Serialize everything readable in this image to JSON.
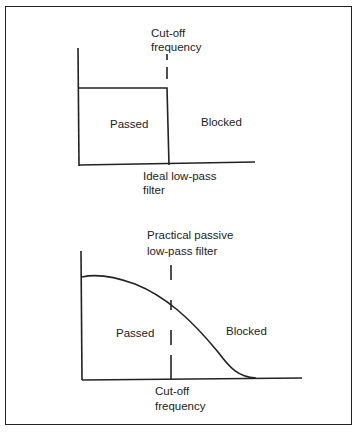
{
  "top_chart": {
    "title_line1": "Cut-off",
    "title_line2": "frequency",
    "passed_label": "Passed",
    "blocked_label": "Blocked",
    "caption_line1": "Ideal low-pass",
    "caption_line2": "filter"
  },
  "bottom_chart": {
    "title_line1": "Practical passive",
    "title_line2": "low-pass filter",
    "passed_label": "Passed",
    "blocked_label": "Blocked",
    "caption_line1": "Cut-off",
    "caption_line2": "frequency"
  },
  "colors": {
    "line": "#222222",
    "background": "#ffffff"
  }
}
